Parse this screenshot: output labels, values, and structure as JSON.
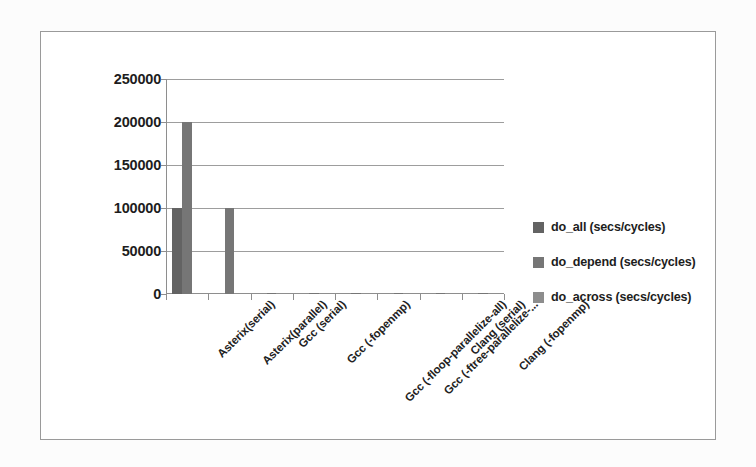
{
  "chart_data": {
    "type": "bar",
    "title": "",
    "xlabel": "",
    "ylabel": "",
    "ylim": [
      0,
      250000
    ],
    "ytick_labels": [
      "0",
      "50000",
      "100000",
      "150000",
      "200000",
      "250000"
    ],
    "yticks": [
      0,
      50000,
      100000,
      150000,
      200000,
      250000
    ],
    "grid": true,
    "legend_position": "right",
    "categories": [
      "Asterix(serial)",
      "Asterix(parallel)",
      "Gcc (serial)",
      "Gcc (-fopenmp)",
      "Gcc (-floop-parallelize-all)",
      "Gcc (-ftree-parallelize-...",
      "Clang (serial)",
      "Clang (-fopenmp)"
    ],
    "series": [
      {
        "name": "do_all (secs/cycles)",
        "color": "#636363",
        "values": [
          100000,
          0,
          0,
          0,
          0,
          0,
          0,
          0
        ]
      },
      {
        "name": "do_depend (secs/cycles)",
        "color": "#767676",
        "values": [
          200000,
          100000,
          1500,
          1500,
          1500,
          1500,
          1500,
          1500
        ]
      },
      {
        "name": "do_across (secs/cycles)",
        "color": "#8d8d8d",
        "values": [
          0,
          0,
          0,
          0,
          0,
          0,
          0,
          0
        ]
      }
    ]
  },
  "legend": {
    "items": [
      {
        "label": "do_all (secs/cycles)"
      },
      {
        "label": "do_depend (secs/cycles)"
      },
      {
        "label": "do_across (secs/cycles)"
      }
    ]
  }
}
